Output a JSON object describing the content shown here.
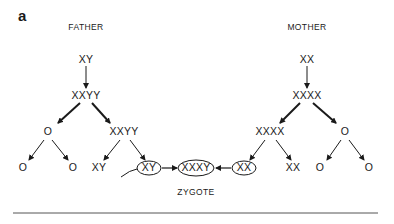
{
  "panel_label": "a",
  "headers": {
    "father": "FATHER",
    "mother": "MOTHER"
  },
  "father": {
    "level0": "XY",
    "level1": "XXYY",
    "level2_left": "O",
    "level2_right": "XXYY",
    "level3": [
      "O",
      "O",
      "XY",
      "XY"
    ]
  },
  "mother": {
    "level0": "XX",
    "level1": "XXXX",
    "level2_left": "XXXX",
    "level2_right": "O",
    "level3": [
      "XX",
      "XX",
      "O",
      "O"
    ]
  },
  "zygote": {
    "genotype": "XXXY",
    "label": "ZYGOTE"
  },
  "colors": {
    "ink": "#1a1a1a",
    "background": "#ffffff",
    "rule": "#555555"
  }
}
